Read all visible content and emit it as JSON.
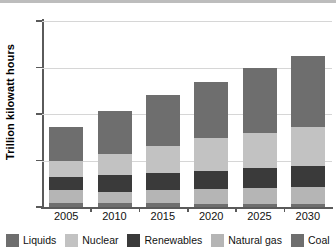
{
  "chart_data": {
    "type": "bar",
    "stacked": true,
    "title": "",
    "subtitle": "",
    "xlabel": "",
    "ylabel": "Trillion kilowatt hours",
    "categories": [
      "2005",
      "2010",
      "2015",
      "2020",
      "2025",
      "2030"
    ],
    "ylim": [
      0,
      40
    ],
    "yticks": [
      0,
      10,
      20,
      30,
      40
    ],
    "ytick_labels": [
      "0",
      "10",
      "20",
      "30",
      "40"
    ],
    "grid": true,
    "grid_axis": "y",
    "legend_position": "bottom",
    "series": [
      {
        "name": "Liquids",
        "color": "#6e6e6e",
        "values": [
          0.9,
          0.9,
          0.8,
          0.7,
          0.6,
          0.6
        ]
      },
      {
        "name": "Natural gas",
        "color": "#b5b5b5",
        "values": [
          2.8,
          2.4,
          2.8,
          3.1,
          3.4,
          3.7
        ]
      },
      {
        "name": "Renewables",
        "color": "#3a3a3a",
        "values": [
          2.7,
          3.6,
          3.8,
          4.0,
          4.4,
          4.6
        ]
      },
      {
        "name": "Nuclear",
        "color": "#c2c2c2",
        "values": [
          3.6,
          4.5,
          5.7,
          7.1,
          7.6,
          8.3
        ]
      },
      {
        "name": "Coal",
        "color": "#6e6e6e",
        "values": [
          7.2,
          9.3,
          11.1,
          11.9,
          13.8,
          15.3
        ]
      }
    ],
    "totals": [
      17.2,
      20.7,
      24.2,
      26.8,
      29.8,
      32.5
    ]
  },
  "axes": {
    "y_title": "Trillion kilowatt hours",
    "y_ticks": [
      {
        "label": "40",
        "value": 40
      },
      {
        "label": "30",
        "value": 30
      },
      {
        "label": "20",
        "value": 20
      },
      {
        "label": "10",
        "value": 10
      },
      {
        "label": "0",
        "value": 0
      }
    ],
    "x_ticks": [
      {
        "label": "2005"
      },
      {
        "label": "2010"
      },
      {
        "label": "2015"
      },
      {
        "label": "2020"
      },
      {
        "label": "2025"
      },
      {
        "label": "2030"
      }
    ]
  },
  "legend": {
    "items": [
      {
        "label": "Liquids",
        "color": "#6e6e6e"
      },
      {
        "label": "Nuclear",
        "color": "#c2c2c2"
      },
      {
        "label": "Renewables",
        "color": "#3a3a3a"
      },
      {
        "label": "Natural gas",
        "color": "#b5b5b5"
      },
      {
        "label": "Coal",
        "color": "#6e6e6e"
      }
    ]
  },
  "colors": {
    "axis": "#5a5a5a",
    "grid": "#d6d6d6",
    "background": "#ffffff",
    "text": "#111111",
    "top_rule": "#bdbdbd"
  }
}
